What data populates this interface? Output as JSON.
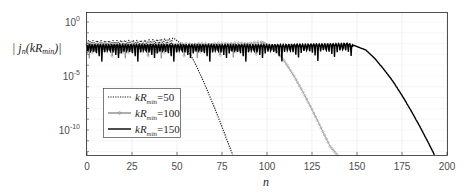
{
  "chart_data": {
    "type": "line",
    "title": "",
    "xlabel": "n",
    "ylabel": "|j_n(kR_min)|",
    "xlim": [
      0,
      200
    ],
    "ylim_log10": [
      -12.3,
      0.9
    ],
    "yscale": "log",
    "grid": true,
    "legend_position": "inside lower-left",
    "xticks": [
      0,
      25,
      50,
      75,
      100,
      125,
      150,
      175,
      200
    ],
    "xtick_labels": [
      "0",
      "25",
      "50",
      "75",
      "100",
      "125",
      "150",
      "175",
      "200"
    ],
    "yticks_log10": [
      0,
      -5,
      -10
    ],
    "ytick_labels": [
      {
        "base": "10",
        "exp": "0"
      },
      {
        "base": "10",
        "exp": "-5"
      },
      {
        "base": "10",
        "exp": "-10"
      }
    ],
    "series": [
      {
        "name": "kR_min=50",
        "label_base": "kR",
        "label_sub": "min",
        "label_val": "=50",
        "style": "dotted",
        "color": "#1a1a1a",
        "marker": "none",
        "kR": 50,
        "points_log10": [
          [
            0,
            -1.7
          ],
          [
            10,
            -1.75
          ],
          [
            20,
            -1.7
          ],
          [
            30,
            -1.7
          ],
          [
            40,
            -1.6
          ],
          [
            48,
            -1.5
          ],
          [
            55,
            -2.3
          ],
          [
            60,
            -3.8
          ],
          [
            65,
            -5.6
          ],
          [
            70,
            -7.6
          ],
          [
            75,
            -9.7
          ],
          [
            80,
            -11.9
          ],
          [
            81,
            -12.3
          ]
        ]
      },
      {
        "name": "kR_min=100",
        "label_base": "kR",
        "label_sub": "min",
        "label_val": "=100",
        "style": "solid",
        "color": "#8c8c8c",
        "marker": "diamond",
        "kR": 100,
        "points_log10": [
          [
            0,
            -2.0
          ],
          [
            50,
            -2.0
          ],
          [
            90,
            -1.9
          ],
          [
            97,
            -1.8
          ],
          [
            105,
            -2.6
          ],
          [
            110,
            -3.7
          ],
          [
            115,
            -5.0
          ],
          [
            120,
            -6.5
          ],
          [
            125,
            -8.1
          ],
          [
            130,
            -9.8
          ],
          [
            135,
            -11.5
          ],
          [
            139,
            -12.3
          ]
        ]
      },
      {
        "name": "kR_min=150",
        "label_base": "kR",
        "label_sub": "min",
        "label_val": "=150",
        "style": "solid",
        "color": "#000000",
        "marker": "none",
        "kR": 150,
        "points_log10": [
          [
            0,
            -2.1
          ],
          [
            100,
            -2.1
          ],
          [
            140,
            -2.0
          ],
          [
            145,
            -1.95
          ],
          [
            155,
            -2.6
          ],
          [
            160,
            -3.4
          ],
          [
            165,
            -4.4
          ],
          [
            170,
            -5.5
          ],
          [
            175,
            -6.8
          ],
          [
            180,
            -8.2
          ],
          [
            185,
            -9.7
          ],
          [
            190,
            -11.3
          ],
          [
            193,
            -12.3
          ]
        ]
      }
    ]
  }
}
